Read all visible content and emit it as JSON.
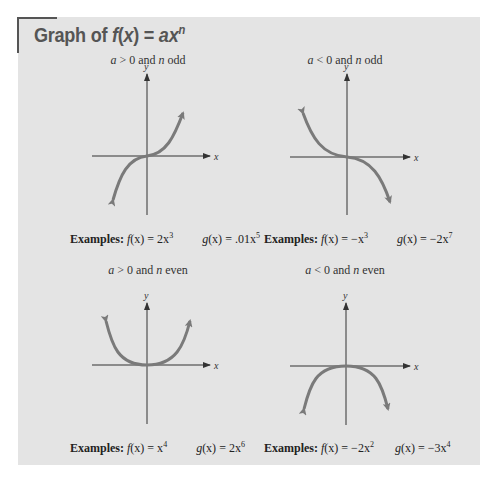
{
  "title": {
    "prefix": "Graph of ",
    "fn": "f",
    "arg": "(x)",
    "equals": " = ",
    "rhs_base": "ax",
    "rhs_exp": "n"
  },
  "panels": [
    {
      "condition": {
        "a": "a",
        "a_rel": " > 0 and ",
        "n": "n",
        "n_rel": " odd"
      },
      "examples_label": "Examples:",
      "f": {
        "name": "f",
        "arg": "(x)",
        "eq": " = 2x",
        "exp": "3"
      },
      "g": {
        "name": "g",
        "arg": "(x)",
        "eq": " = .01x",
        "exp": "5"
      },
      "axis_labels": {
        "x": "x",
        "y": "y"
      }
    },
    {
      "condition": {
        "a": "a",
        "a_rel": " < 0 and ",
        "n": "n",
        "n_rel": " odd"
      },
      "examples_label": "Examples:",
      "f": {
        "name": "f",
        "arg": "(x)",
        "eq": " = −x",
        "exp": "3"
      },
      "g": {
        "name": "g",
        "arg": "(x)",
        "eq": " = −2x",
        "exp": "7"
      },
      "axis_labels": {
        "x": "x",
        "y": "y"
      }
    },
    {
      "condition": {
        "a": "a",
        "a_rel": " > 0 and ",
        "n": "n",
        "n_rel": " even"
      },
      "examples_label": "Examples:",
      "f": {
        "name": "f",
        "arg": "(x)",
        "eq": " = x",
        "exp": "4"
      },
      "g": {
        "name": "g",
        "arg": "(x)",
        "eq": " = 2x",
        "exp": "6"
      },
      "axis_labels": {
        "x": "x",
        "y": "y"
      }
    },
    {
      "condition": {
        "a": "a",
        "a_rel": " < 0 and ",
        "n": "n",
        "n_rel": " even"
      },
      "examples_label": "Examples:",
      "f": {
        "name": "f",
        "arg": "(x)",
        "eq": " = −2x",
        "exp": "2"
      },
      "g": {
        "name": "g",
        "arg": "(x)",
        "eq": " = −3x",
        "exp": "4"
      },
      "axis_labels": {
        "x": "x",
        "y": "y"
      }
    }
  ],
  "colors": {
    "panel_bg": "#e4e4e4",
    "curve": "#7a7a7a",
    "axis": "#333333",
    "title": "#555555"
  }
}
